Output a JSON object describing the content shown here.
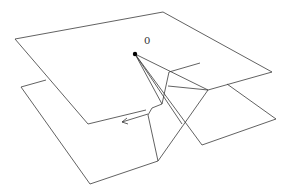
{
  "diagram": {
    "type": "geometric-3d-figure",
    "point_label": "0",
    "line_color": "#3a3a3a",
    "point_color": "#000000",
    "background": "#ffffff"
  }
}
